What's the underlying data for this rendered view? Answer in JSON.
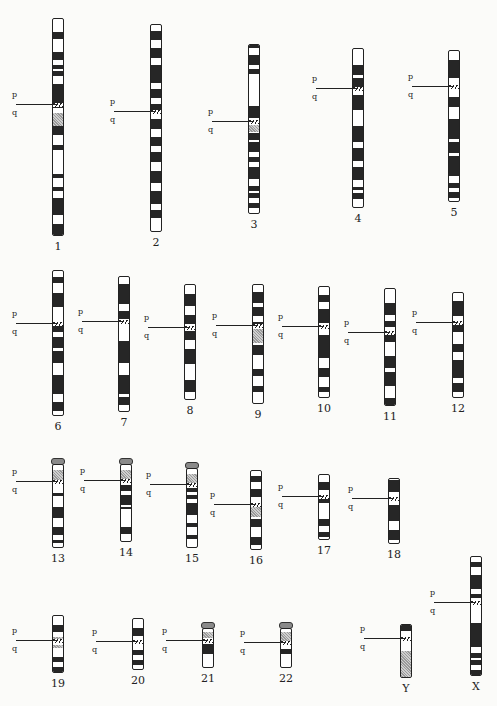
{
  "figure": {
    "arm_labels": {
      "p": "p",
      "q": "q"
    }
  },
  "chromosomes": [
    {
      "name": "1",
      "x": 52,
      "top": 18,
      "h": 218,
      "cen": 0.395,
      "p_labels": [
        "36",
        "35",
        "34",
        "33",
        "32",
        "31",
        "22",
        "21",
        "13",
        "11"
      ],
      "q_labels": [
        "12",
        "21",
        "22",
        "23",
        "24",
        "25",
        "31",
        "32",
        "41",
        "42",
        "43",
        "44"
      ],
      "dark": [
        [
          0.06,
          0.09
        ],
        [
          0.15,
          0.19
        ],
        [
          0.21,
          0.23
        ],
        [
          0.24,
          0.26
        ],
        [
          0.3,
          0.41
        ],
        [
          0.47,
          0.53
        ],
        [
          0.58,
          0.6
        ],
        [
          0.71,
          0.73
        ],
        [
          0.77,
          0.79
        ],
        [
          0.82,
          0.9
        ],
        [
          0.94,
          0.99
        ],
        [
          1.06,
          1.12
        ],
        [
          1.14,
          1.16
        ]
      ],
      "grey": [
        [
          0.43,
          0.49
        ]
      ]
    },
    {
      "name": "2",
      "x": 150,
      "top": 24,
      "h": 208,
      "cen": 0.42,
      "p_labels": [
        "25",
        "24",
        "23",
        "22",
        "21",
        "16",
        "15",
        "13",
        "12",
        "11"
      ],
      "q_labels": [
        "11",
        "12",
        "13",
        "14",
        "21",
        "22",
        "23",
        "24",
        "31",
        "32",
        "33",
        "34",
        "35",
        "36",
        "37"
      ],
      "dark": [
        [
          0.03,
          0.07
        ],
        [
          0.11,
          0.16
        ],
        [
          0.19,
          0.28
        ],
        [
          0.31,
          0.35
        ],
        [
          0.38,
          0.41
        ],
        [
          0.45,
          0.5
        ],
        [
          0.54,
          0.58
        ],
        [
          0.61,
          0.66
        ],
        [
          0.7,
          0.76
        ],
        [
          0.8,
          0.86
        ],
        [
          0.89,
          0.93
        ]
      ],
      "grey": []
    },
    {
      "name": "3",
      "x": 248,
      "top": 44,
      "h": 170,
      "cen": 0.455,
      "p_labels": [
        "26",
        "25",
        "24",
        "23",
        "22",
        "21",
        "14",
        "13",
        "12"
      ],
      "q_labels": [
        "12",
        "13",
        "21",
        "22",
        "23",
        "24",
        "25",
        "26",
        "27",
        "28",
        "29"
      ],
      "dark": [
        [
          0.0,
          0.02
        ],
        [
          0.06,
          0.12
        ],
        [
          0.14,
          0.17
        ],
        [
          0.36,
          0.43
        ],
        [
          0.52,
          0.56
        ],
        [
          0.57,
          0.63
        ],
        [
          0.66,
          0.69
        ],
        [
          0.72,
          0.79
        ],
        [
          0.83,
          0.86
        ],
        [
          0.87,
          0.9
        ],
        [
          0.93,
          0.96
        ]
      ],
      "grey": [
        [
          0.47,
          0.51
        ]
      ]
    },
    {
      "name": "4",
      "x": 352,
      "top": 48,
      "h": 160,
      "cen": 0.25,
      "p_labels": [
        "16",
        "15",
        "14",
        "13",
        "12"
      ],
      "q_labels": [
        "12",
        "13",
        "21",
        "22",
        "23",
        "24",
        "25",
        "26",
        "27",
        "28",
        "31",
        "32",
        "33",
        "34",
        "35"
      ],
      "dark": [
        [
          0.1,
          0.16
        ],
        [
          0.18,
          0.24
        ],
        [
          0.29,
          0.38
        ],
        [
          0.48,
          0.58
        ],
        [
          0.62,
          0.7
        ],
        [
          0.74,
          0.82
        ],
        [
          0.86,
          0.88
        ],
        [
          0.9,
          0.94
        ]
      ],
      "grey": []
    },
    {
      "name": "5",
      "x": 448,
      "top": 50,
      "h": 152,
      "cen": 0.24,
      "p_labels": [
        "15",
        "14",
        "13",
        "12",
        "11"
      ],
      "q_labels": [
        "11",
        "12",
        "13",
        "14",
        "15",
        "21",
        "22",
        "23",
        "31",
        "32",
        "33",
        "34",
        "35"
      ],
      "dark": [
        [
          0.06,
          0.18
        ],
        [
          0.3,
          0.37
        ],
        [
          0.45,
          0.58
        ],
        [
          0.6,
          0.67
        ],
        [
          0.69,
          0.82
        ],
        [
          0.87,
          0.9
        ],
        [
          0.93,
          0.97
        ]
      ],
      "grey": []
    },
    {
      "name": "6",
      "x": 52,
      "top": 270,
      "h": 146,
      "cen": 0.36,
      "p_labels": [
        "25",
        "24",
        "23",
        "22",
        "21",
        "12"
      ],
      "q_labels": [
        "13",
        "14",
        "15",
        "16",
        "21",
        "22",
        "23",
        "24",
        "25",
        "26",
        "27"
      ],
      "dark": [
        [
          0.04,
          0.08
        ],
        [
          0.15,
          0.25
        ],
        [
          0.37,
          0.42
        ],
        [
          0.45,
          0.53
        ],
        [
          0.55,
          0.63
        ],
        [
          0.71,
          0.84
        ],
        [
          0.9,
          0.96
        ]
      ],
      "grey": []
    },
    {
      "name": "7",
      "x": 118,
      "top": 276,
      "h": 136,
      "cen": 0.33,
      "p_labels": [
        "22",
        "21",
        "15",
        "14",
        "13",
        "12",
        "11"
      ],
      "q_labels": [
        "11",
        "21",
        "22",
        "31",
        "32",
        "33",
        "34",
        "35",
        "36"
      ],
      "dark": [
        [
          0.05,
          0.2
        ],
        [
          0.25,
          0.31
        ],
        [
          0.47,
          0.63
        ],
        [
          0.72,
          0.86
        ],
        [
          0.88,
          0.94
        ]
      ],
      "grey": []
    },
    {
      "name": "8",
      "x": 184,
      "top": 284,
      "h": 116,
      "cen": 0.37,
      "p_labels": [
        "23",
        "22",
        "21",
        "12",
        "11"
      ],
      "q_labels": [
        "12",
        "13",
        "21",
        "22",
        "23",
        "24"
      ],
      "dark": [
        [
          0.08,
          0.18
        ],
        [
          0.26,
          0.34
        ],
        [
          0.4,
          0.47
        ],
        [
          0.55,
          0.68
        ],
        [
          0.82,
          0.92
        ]
      ],
      "grey": []
    },
    {
      "name": "9",
      "x": 252,
      "top": 284,
      "h": 120,
      "cen": 0.34,
      "p_labels": [
        "24",
        "23",
        "22",
        "21",
        "13",
        "12"
      ],
      "q_labels": [
        "12",
        "13",
        "21",
        "22",
        "31",
        "32",
        "33",
        "34"
      ],
      "dark": [
        [
          0.06,
          0.15
        ],
        [
          0.18,
          0.26
        ],
        [
          0.31,
          0.36
        ],
        [
          0.5,
          0.58
        ],
        [
          0.7,
          0.76
        ],
        [
          0.84,
          0.89
        ]
      ],
      "grey": [
        [
          0.37,
          0.48
        ]
      ]
    },
    {
      "name": "10",
      "x": 318,
      "top": 286,
      "h": 112,
      "cen": 0.36,
      "p_labels": [
        "15",
        "14",
        "13",
        "12",
        "11"
      ],
      "q_labels": [
        "11",
        "21",
        "22",
        "23",
        "24",
        "25",
        "26"
      ],
      "dark": [
        [
          0.07,
          0.13
        ],
        [
          0.2,
          0.32
        ],
        [
          0.43,
          0.63
        ],
        [
          0.72,
          0.8
        ],
        [
          0.89,
          0.94
        ]
      ],
      "grey": []
    },
    {
      "name": "11",
      "x": 384,
      "top": 288,
      "h": 118,
      "cen": 0.37,
      "p_labels": [
        "15",
        "14",
        "13",
        "12",
        "11"
      ],
      "q_labels": [
        "12",
        "13",
        "14",
        "21",
        "22",
        "23",
        "24",
        "25"
      ],
      "dark": [
        [
          0.12,
          0.22
        ],
        [
          0.27,
          0.32
        ],
        [
          0.38,
          0.45
        ],
        [
          0.57,
          0.67
        ],
        [
          0.7,
          0.82
        ],
        [
          0.92,
          0.99
        ]
      ],
      "grey": []
    },
    {
      "name": "12",
      "x": 452,
      "top": 292,
      "h": 106,
      "cen": 0.28,
      "p_labels": [
        "13",
        "12",
        "11"
      ],
      "q_labels": [
        "12",
        "13",
        "14",
        "15",
        "21",
        "22",
        "23",
        "24"
      ],
      "dark": [
        [
          0.08,
          0.22
        ],
        [
          0.29,
          0.37
        ],
        [
          0.48,
          0.56
        ],
        [
          0.63,
          0.8
        ],
        [
          0.85,
          0.93
        ]
      ],
      "grey": []
    },
    {
      "name": "13",
      "x": 52,
      "top": 458,
      "h": 90,
      "cen": 0.2,
      "acro": true,
      "p_labels": [
        "13",
        "12",
        "11"
      ],
      "q_labels": [
        "12",
        "13",
        "14",
        "21",
        "22",
        "31",
        "32",
        "33",
        "34"
      ],
      "dark": [
        [
          0.33,
          0.37
        ],
        [
          0.5,
          0.63
        ],
        [
          0.74,
          0.83
        ],
        [
          0.89,
          0.93
        ]
      ],
      "grey": [
        [
          0.06,
          0.19
        ]
      ]
    },
    {
      "name": "14",
      "x": 120,
      "top": 458,
      "h": 84,
      "cen": 0.2,
      "acro": true,
      "p_labels": [
        "13",
        "12",
        "11"
      ],
      "q_labels": [
        "12",
        "13",
        "21",
        "22",
        "23",
        "24",
        "31",
        "32"
      ],
      "dark": [
        [
          0.26,
          0.33
        ],
        [
          0.39,
          0.51
        ],
        [
          0.54,
          0.57
        ],
        [
          0.79,
          0.88
        ]
      ],
      "grey": [
        [
          0.06,
          0.19
        ]
      ]
    },
    {
      "name": "15",
      "x": 186,
      "top": 462,
      "h": 86,
      "cen": 0.2,
      "acro": true,
      "p_labels": [
        "13",
        "12",
        "11"
      ],
      "q_labels": [
        "12",
        "14",
        "15",
        "21",
        "22",
        "23",
        "24",
        "25",
        "26"
      ],
      "dark": [
        [
          0.24,
          0.29
        ],
        [
          0.32,
          0.37
        ],
        [
          0.42,
          0.58
        ],
        [
          0.68,
          0.73
        ],
        [
          0.82,
          0.88
        ]
      ],
      "grey": [
        [
          0.06,
          0.19
        ]
      ]
    },
    {
      "name": "16",
      "x": 250,
      "top": 470,
      "h": 80,
      "cen": 0.42,
      "p_labels": [
        "13",
        "p12",
        "11"
      ],
      "q_labels": [
        "11.2",
        "q13",
        "21",
        "22",
        "23",
        "24"
      ],
      "dark": [
        [
          0.06,
          0.14
        ],
        [
          0.23,
          0.32
        ],
        [
          0.6,
          0.7
        ],
        [
          0.83,
          0.93
        ]
      ],
      "grey": [
        [
          0.45,
          0.57
        ]
      ]
    },
    {
      "name": "17",
      "x": 318,
      "top": 474,
      "h": 66,
      "cen": 0.33,
      "p_labels": [
        "13",
        "12",
        "11"
      ],
      "q_labels": [
        "12",
        "21",
        "22",
        "23",
        "24",
        "25"
      ],
      "dark": [
        [
          0.1,
          0.22
        ],
        [
          0.36,
          0.42
        ],
        [
          0.66,
          0.78
        ],
        [
          0.86,
          0.94
        ]
      ],
      "grey": []
    },
    {
      "name": "18",
      "x": 388,
      "top": 478,
      "h": 66,
      "cen": 0.3,
      "p_labels": [
        "p11.3",
        "11.2"
      ],
      "q_labels": [
        "11",
        "q12",
        "21",
        "22",
        "23"
      ],
      "dark": [
        [
          0.02,
          0.2
        ],
        [
          0.4,
          0.64
        ],
        [
          0.78,
          0.92
        ]
      ],
      "grey": []
    },
    {
      "name": "19",
      "x": 52,
      "top": 615,
      "h": 58,
      "cen": 0.43,
      "p_labels": [
        "13.3",
        "p 13.2",
        "13.1"
      ],
      "q_labels": [
        "12",
        "q 13.1",
        "13.2",
        "13.3",
        "13.4"
      ],
      "dark": [
        [
          0.15,
          0.28
        ],
        [
          0.71,
          0.79
        ],
        [
          0.88,
          0.99
        ]
      ],
      "grey": [
        [
          0.36,
          0.42
        ],
        [
          0.5,
          0.56
        ]
      ]
    },
    {
      "name": "20",
      "x": 132,
      "top": 618,
      "h": 52,
      "cen": 0.45,
      "p_labels": [
        "13",
        "p 12",
        "11.2"
      ],
      "q_labels": [
        "q 12",
        "13.2"
      ],
      "dark": [
        [
          0.17,
          0.33
        ],
        [
          0.6,
          0.7
        ],
        [
          0.78,
          0.88
        ]
      ],
      "grey": []
    },
    {
      "name": "21",
      "x": 202,
      "top": 622,
      "h": 46,
      "cen": 0.3,
      "acro": true,
      "p_labels": [
        "p 13",
        "11.2"
      ],
      "q_labels": [
        "q 21",
        "22"
      ],
      "dark": [
        [
          0.38,
          0.62
        ]
      ],
      "grey": [
        [
          0.08,
          0.22
        ]
      ]
    },
    {
      "name": "22",
      "x": 280,
      "top": 622,
      "h": 46,
      "cen": 0.36,
      "acro": true,
      "p_labels": [
        "p 13",
        "12",
        "11.2"
      ],
      "q_labels": [
        "q 12",
        "13"
      ],
      "dark": [
        [
          0.5,
          0.62
        ]
      ],
      "grey": [
        [
          0.08,
          0.3
        ]
      ]
    },
    {
      "name": "Y",
      "x": 400,
      "top": 624,
      "h": 54,
      "cen": 0.25,
      "p_labels": [
        "P 11.3"
      ],
      "q_labels": [
        "q 11.2",
        "12"
      ],
      "dark": [
        [
          0.0,
          0.12
        ]
      ],
      "grey": [
        [
          0.48,
          1.0
        ]
      ]
    },
    {
      "name": "X",
      "x": 470,
      "top": 556,
      "h": 120,
      "cen": 0.38,
      "p_labels": [
        "22.3",
        "22.1",
        "21",
        "p11.4",
        "11.2"
      ],
      "q_labels": [
        "q13",
        "21",
        "22",
        "23",
        "24",
        "25",
        "26",
        "27",
        "28"
      ],
      "dark": [
        [
          0.04,
          0.08
        ],
        [
          0.15,
          0.27
        ],
        [
          0.31,
          0.34
        ],
        [
          0.55,
          0.75
        ],
        [
          0.8,
          0.84
        ],
        [
          0.86,
          0.9
        ],
        [
          0.94,
          0.99
        ]
      ],
      "grey": []
    }
  ]
}
